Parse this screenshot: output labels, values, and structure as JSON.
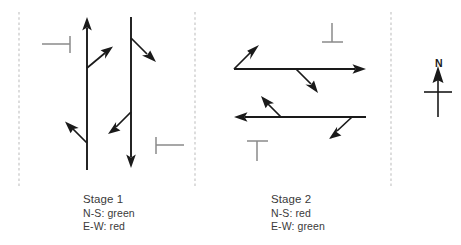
{
  "figure": {
    "kind": "traffic-signal-staging-diagram",
    "background_color": "#ffffff",
    "line_color": "#1a1a1a",
    "stopline_color": "#8a8a8a",
    "divider_color": "#c6c6c6"
  },
  "stages": [
    {
      "id": "stage-1",
      "title": "Stage 1",
      "ns_state": "N-S: green",
      "ew_state": "E-W: red",
      "approaches": [
        {
          "name": "northbound-through",
          "direction": "north"
        },
        {
          "name": "northbound-right-turn",
          "direction": "north-east"
        },
        {
          "name": "northbound-left-turn",
          "direction": "north-west"
        },
        {
          "name": "southbound-through",
          "direction": "south"
        },
        {
          "name": "southbound-left-turn",
          "direction": "south-east"
        },
        {
          "name": "southbound-right-turn",
          "direction": "south-west"
        }
      ],
      "stoplines": [
        "west-approach-stopline",
        "east-approach-stopline"
      ]
    },
    {
      "id": "stage-2",
      "title": "Stage 2",
      "ns_state": "N-S: red",
      "ew_state": "E-W: green",
      "approaches": [
        {
          "name": "eastbound-through",
          "direction": "east"
        },
        {
          "name": "eastbound-left-turn",
          "direction": "north-east"
        },
        {
          "name": "eastbound-right-turn",
          "direction": "south-east"
        },
        {
          "name": "westbound-through",
          "direction": "west"
        },
        {
          "name": "westbound-left-turn",
          "direction": "north-west"
        },
        {
          "name": "westbound-right-turn",
          "direction": "south-west"
        }
      ],
      "stoplines": [
        "north-approach-stopline",
        "south-approach-stopline"
      ]
    }
  ],
  "compass": {
    "label": "N",
    "points_to": "north"
  }
}
